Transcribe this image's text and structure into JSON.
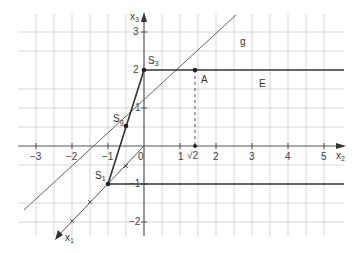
{
  "diagram": {
    "title": "",
    "colors": {
      "grid": "#c8c8c8",
      "axis": "#555555",
      "thick_line": "#333333",
      "thin_line": "#666666",
      "text": "#333333"
    },
    "axes": {
      "x2": {
        "label": "x",
        "sub": "2",
        "ticks": [
          "−3",
          "−2",
          "−1",
          "0",
          "1",
          "√2",
          "2",
          "3",
          "4",
          "5"
        ]
      },
      "x3": {
        "label": "x",
        "sub": "3",
        "ticks": [
          "3",
          "2",
          "1",
          "−1",
          "−2"
        ]
      },
      "x1": {
        "label": "x",
        "sub": "1"
      }
    },
    "points": {
      "S3": {
        "label": "S",
        "sub": "3",
        "coords": "x3 = 2"
      },
      "Sg": {
        "label": "S",
        "sub": "g"
      },
      "S1": {
        "label": "S",
        "sub": "1",
        "coords": "x3 = −1"
      },
      "A": {
        "label": "A",
        "coords": "x2 = √2, x3 = 2"
      }
    },
    "lines": {
      "g": {
        "label": "g"
      },
      "E": {
        "label": "E"
      }
    }
  }
}
